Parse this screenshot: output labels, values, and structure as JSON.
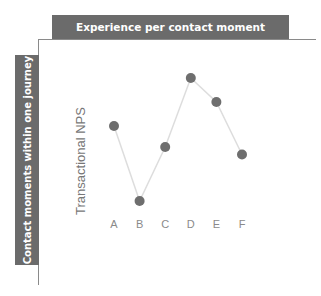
{
  "header": {
    "title": "Experience per contact moment"
  },
  "side": {
    "label": "Contact moments within one journey"
  },
  "chart_data": {
    "type": "line",
    "title": "Experience per contact moment",
    "xlabel": "Contact moments within one journey",
    "ylabel": "Transactional NPS",
    "categories": [
      "A",
      "B",
      "C",
      "D",
      "E",
      "F"
    ],
    "values": [
      6.0,
      1.0,
      4.6,
      9.2,
      7.6,
      4.1
    ],
    "ylim": [
      0,
      10
    ],
    "grid": false,
    "legend": null,
    "series": [
      {
        "name": "Transactional NPS",
        "values": [
          6.0,
          1.0,
          4.6,
          9.2,
          7.6,
          4.1
        ]
      }
    ],
    "colors": {
      "marker": "#6e6e6e",
      "line": "#dddddd",
      "bars": "#6b6b6b",
      "axis": "#8a8a8a"
    }
  }
}
